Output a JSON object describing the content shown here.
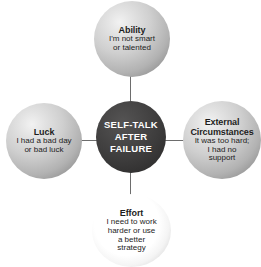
{
  "diagram": {
    "center": {
      "line1": "SELF-TALK",
      "line2": "AFTER",
      "line3": "FAILURE"
    },
    "nodes": [
      {
        "id": "ability",
        "position": "top",
        "title": "Ability",
        "desc_line1": "I'm not smart",
        "desc_line2": "or talented"
      },
      {
        "id": "luck",
        "position": "left",
        "title": "Luck",
        "desc_line1": "I had a bad day",
        "desc_line2": "or bad luck"
      },
      {
        "id": "external-circumstances",
        "position": "right",
        "title_line1": "External",
        "title_line2": "Circumstances",
        "desc_line1": "It was too hard;",
        "desc_line2": "I had no",
        "desc_line3": "support"
      },
      {
        "id": "effort",
        "position": "bottom",
        "title": "Effort",
        "desc_line1": "I need to work",
        "desc_line2": "harder or use",
        "desc_line3": "a better",
        "desc_line4": "strategy"
      }
    ],
    "colors": {
      "center_fill": "#3c3b3b",
      "center_text": "#ffffff",
      "satellite_fill": "#cfcfcf",
      "bottom_fill": "#ffffff",
      "connector": "#6d6d6d",
      "body_text": "#1d1d1d",
      "background": "#ffffff"
    }
  }
}
